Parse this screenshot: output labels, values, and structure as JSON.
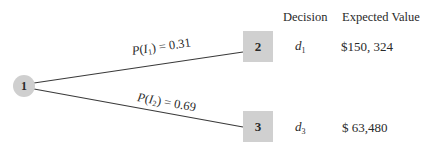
{
  "diagram": {
    "type": "decision-tree",
    "colors": {
      "node_fill": "#cfcfcf",
      "line": "#3a3a3a",
      "text": "#2a2a2a",
      "background": "#ffffff"
    },
    "root": {
      "label": "1",
      "shape": "circle"
    },
    "branches": [
      {
        "prob_func": "P",
        "prob_var": "I",
        "prob_sub": "1",
        "prob_value": "= 0.31",
        "target": {
          "label": "2",
          "shape": "square"
        },
        "decision_var": "d",
        "decision_sub": "1",
        "expected_value": "$150, 324"
      },
      {
        "prob_func": "P",
        "prob_var": "I",
        "prob_sub": "2",
        "prob_value": "= 0.69",
        "target": {
          "label": "3",
          "shape": "square"
        },
        "decision_var": "d",
        "decision_sub": "3",
        "expected_value": "$ 63,480"
      }
    ],
    "headers": {
      "decision": "Decision",
      "expected_value": "Expected Value"
    }
  }
}
